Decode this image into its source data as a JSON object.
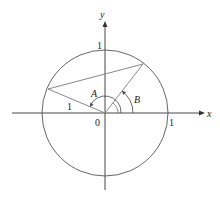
{
  "diagram": {
    "type": "unit-circle",
    "center": {
      "x": 105,
      "y": 113
    },
    "radius": 63,
    "colors": {
      "axis": "#333333",
      "circle": "#555555",
      "segment": "#888888",
      "text": "#222222"
    },
    "axes": {
      "x_label": "x",
      "y_label": "y",
      "origin_label": "0",
      "x_tick_label": "1",
      "y_tick_label": "1"
    },
    "angles": [
      {
        "label": "A"
      },
      {
        "label": "B"
      }
    ],
    "segment_label": "1"
  }
}
